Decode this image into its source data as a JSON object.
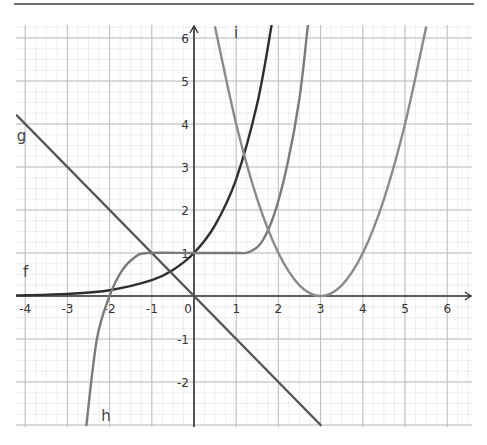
{
  "chart_data": {
    "type": "line",
    "title": "",
    "xlabel": "",
    "ylabel": "",
    "xlim": [
      -4.2,
      6.5
    ],
    "ylim": [
      -3,
      6.3
    ],
    "grid": true,
    "minor_grid": true,
    "x_ticks": [
      "-4",
      "-3",
      "-2",
      "-1",
      "0",
      "1",
      "2",
      "3",
      "4",
      "5",
      "6"
    ],
    "y_ticks": [
      "-2",
      "-1",
      "1",
      "2",
      "3",
      "4",
      "5",
      "6"
    ],
    "series": [
      {
        "name": "f",
        "label": "f",
        "description": "exponential e^x",
        "color": "#2e2e2e",
        "points": [
          [
            -4.2,
            0.015
          ],
          [
            -4,
            0.018
          ],
          [
            -3,
            0.05
          ],
          [
            -2,
            0.135
          ],
          [
            -1,
            0.368
          ],
          [
            -0.5,
            0.607
          ],
          [
            0,
            1
          ],
          [
            0.5,
            1.649
          ],
          [
            1,
            2.718
          ],
          [
            1.5,
            4.482
          ],
          [
            1.84,
            6.3
          ]
        ]
      },
      {
        "name": "g",
        "label": "g",
        "description": "line y = -x",
        "color": "#555555",
        "points": [
          [
            -4.2,
            4.2
          ],
          [
            -3,
            3
          ],
          [
            -2,
            2
          ],
          [
            -1,
            1
          ],
          [
            0,
            0
          ],
          [
            1,
            -1
          ],
          [
            2,
            -2
          ],
          [
            3,
            -3
          ]
        ]
      },
      {
        "name": "h",
        "label": "h",
        "description": "rises through (-2,0), plateau at y=1 from x=-1 to ~1.3, then rises steeply",
        "color": "#7a7a7a",
        "points": [
          [
            -2.55,
            -3
          ],
          [
            -2.3,
            -1
          ],
          [
            -2,
            0
          ],
          [
            -1.7,
            0.6
          ],
          [
            -1.4,
            0.9
          ],
          [
            -1.1,
            1
          ],
          [
            0,
            1
          ],
          [
            1,
            1
          ],
          [
            1.3,
            1.02
          ],
          [
            1.6,
            1.25
          ],
          [
            1.9,
            1.9
          ],
          [
            2.2,
            3.0
          ],
          [
            2.5,
            4.6
          ],
          [
            2.7,
            6.3
          ]
        ]
      },
      {
        "name": "i",
        "label": "i",
        "description": "parabola (x-3)^2",
        "color": "#8a8a8a",
        "points": [
          [
            0.5,
            6.25
          ],
          [
            1,
            4
          ],
          [
            1.5,
            2.25
          ],
          [
            2,
            1
          ],
          [
            2.5,
            0.25
          ],
          [
            3,
            0
          ],
          [
            3.5,
            0.25
          ],
          [
            4,
            1
          ],
          [
            4.5,
            2.25
          ],
          [
            5,
            4
          ],
          [
            5.5,
            6.25
          ]
        ]
      }
    ],
    "labels": [
      {
        "text": "f",
        "x": -4.05,
        "y": 0.45
      },
      {
        "text": "g",
        "x": -4.2,
        "y": 3.6
      },
      {
        "text": "h",
        "x": -2.2,
        "y": -2.9
      },
      {
        "text": "i",
        "x": 0.95,
        "y": 6.0
      }
    ]
  },
  "axes": {
    "origin_label": "0"
  }
}
